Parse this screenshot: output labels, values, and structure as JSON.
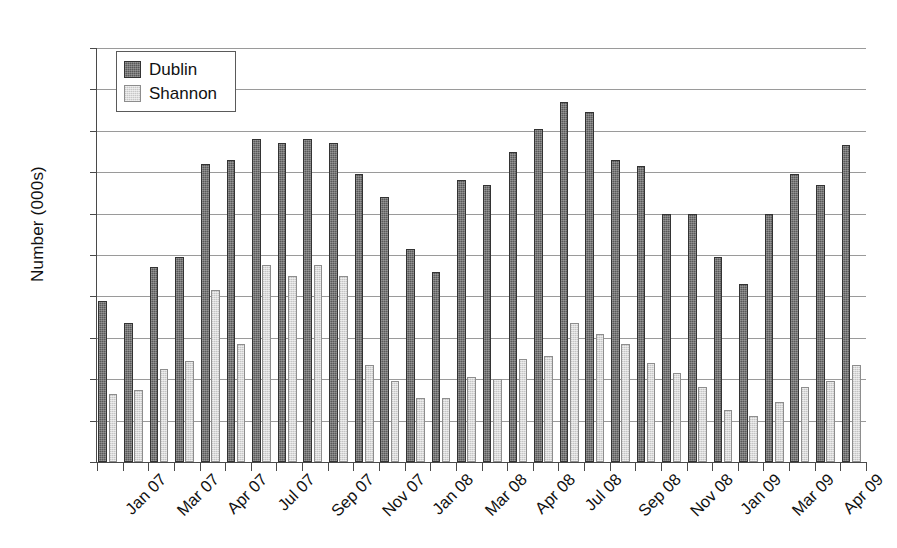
{
  "chart_data": {
    "type": "bar",
    "title": "",
    "xlabel": "",
    "ylabel": "Number (000s)",
    "ylim": [
      0,
      200
    ],
    "ytick_step": 20,
    "yticks": [
      200,
      180,
      160,
      140,
      120,
      100,
      80,
      60,
      40,
      20,
      0
    ],
    "grid": true,
    "legend_position": "top-left",
    "colors": {
      "dublin": "#595959",
      "shannon": "#d9d9d9",
      "axis": "#4a4a4a",
      "gridline": "#9a9a9a",
      "text": "#111111"
    },
    "categories": [
      "Jan 07",
      "Feb 07",
      "Mar 07",
      "Apr 07",
      "May 07",
      "Jun 07",
      "Jul 07",
      "Aug 07",
      "Sep 07",
      "Oct 07",
      "Nov 07",
      "Dec 07",
      "Jan 08",
      "Feb 08",
      "Mar 08",
      "Apr 08",
      "May 08",
      "Jun 08",
      "Jul 08",
      "Aug 08",
      "Sep 08",
      "Oct 08",
      "Nov 08",
      "Dec 08",
      "Jan 09",
      "Feb 09",
      "Mar 09",
      "Apr 09",
      "May 09",
      "Jun 09"
    ],
    "tick_labels_shown": [
      "Jan 07",
      "Mar 07",
      "Apr 07",
      "Jul 07",
      "Sep 07",
      "Nov 07",
      "Jan 08",
      "Mar 08",
      "Apr 08",
      "Jul 08",
      "Sep 08",
      "Nov 08",
      "Jan 09",
      "Mar 09",
      "Apr 09"
    ],
    "series": [
      {
        "name": "Dublin",
        "values": [
          78,
          67,
          94,
          99,
          144,
          146,
          156,
          154,
          156,
          154,
          139,
          128,
          103,
          92,
          136,
          134,
          150,
          161,
          174,
          169,
          146,
          143,
          120,
          120,
          99,
          86,
          120,
          139,
          134,
          153
        ]
      },
      {
        "name": "Shannon",
        "values": [
          33,
          35,
          45,
          49,
          83,
          57,
          95,
          90,
          95,
          90,
          47,
          39,
          31,
          31,
          41,
          40,
          50,
          51,
          67,
          62,
          57,
          48,
          43,
          36,
          25,
          22,
          29,
          36,
          39,
          47
        ]
      }
    ]
  },
  "legend": {
    "items": [
      {
        "label": "Dublin",
        "key": "dublin"
      },
      {
        "label": "Shannon",
        "key": "shannon"
      }
    ]
  },
  "axis": {
    "y_title": "Number (000s)"
  }
}
